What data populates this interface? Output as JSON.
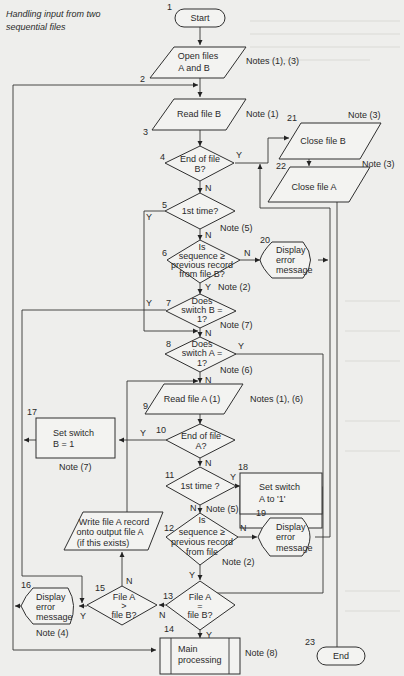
{
  "title": {
    "line1": "Handling input from two",
    "line2": "sequential files"
  },
  "colors": {
    "background": "#eeeeec",
    "line": "#333333",
    "shape_fill": "#f3f3f1"
  },
  "nodes": {
    "n1": {
      "num": "1",
      "type": "terminal",
      "label": "Start"
    },
    "n2": {
      "num": "2"
    },
    "n2box": {
      "type": "io",
      "line1": "Open files",
      "line2": "A and B",
      "note": "Notes (1), (3)"
    },
    "n3": {
      "num": "3",
      "type": "io",
      "label": "Read file B",
      "note": "Note (1)"
    },
    "n4": {
      "num": "4",
      "type": "decision",
      "line1": "End of file",
      "line2": "B?",
      "yes": "Y",
      "no": "N"
    },
    "n5": {
      "num": "5",
      "type": "decision",
      "label": "1st time?",
      "yes": "Y",
      "no": "N",
      "note": "Note (5)"
    },
    "n6": {
      "num": "6",
      "type": "decision",
      "line1": "Is",
      "line2": "sequence ≥",
      "line3": "previous record",
      "line4": "from file B?",
      "yes": "Y",
      "no": "N",
      "note": "Note (2)"
    },
    "n7": {
      "num": "7",
      "type": "decision",
      "line1": "Does",
      "line2": "switch B =",
      "line3": "1?",
      "yes": "Y",
      "no": "N",
      "note": "Note (7)"
    },
    "n8": {
      "num": "8",
      "type": "decision",
      "line1": "Does",
      "line2": "switch A =",
      "line3": "1?",
      "yes": "Y",
      "no": "N",
      "note": "Note (6)"
    },
    "n9": {
      "num": "9",
      "type": "io",
      "label": "Read file A (1)",
      "note": "Notes (1), (6)"
    },
    "n10": {
      "num": "10",
      "type": "decision",
      "line1": "End of file",
      "line2": "A?",
      "yes": "Y",
      "no": "N"
    },
    "n11": {
      "num": "11",
      "type": "decision",
      "label": "1st time ?",
      "yes": "Y",
      "no": "N",
      "note": "Note (5)"
    },
    "n12": {
      "num": "12",
      "type": "decision",
      "line1": "Is",
      "line2": "sequence ≥",
      "line3": "previous record",
      "line4": "from file",
      "yes": "Y",
      "no": "N",
      "note": "Note (2)"
    },
    "n13": {
      "num": "13",
      "type": "decision",
      "line1": "File A",
      "line2": "=",
      "line3": "file B?",
      "yes": "Y",
      "no": "N"
    },
    "n14": {
      "num": "14",
      "type": "predefined",
      "line1": "Main",
      "line2": "processing",
      "note": "Note (8)"
    },
    "n15": {
      "num": "15",
      "type": "decision",
      "line1": "File A",
      "line2": ">",
      "line3": "file B?",
      "yes": "Y",
      "no": "N"
    },
    "n16": {
      "num": "16",
      "type": "display",
      "line1": "Display",
      "line2": "error",
      "line3": "message",
      "note": "Note (4)"
    },
    "n17": {
      "num": "17",
      "type": "process",
      "line1": "Set switch",
      "line2": "B = 1",
      "note": "Note (7)"
    },
    "n18": {
      "num": "18",
      "type": "process",
      "line1": "Set switch",
      "line2": "A to '1'"
    },
    "n19": {
      "num": "19",
      "type": "display",
      "line1": "Display",
      "line2": "error",
      "line3": "message"
    },
    "n20": {
      "num": "20",
      "type": "display",
      "line1": "Display",
      "line2": "error",
      "line3": "message"
    },
    "n21": {
      "num": "21",
      "type": "io",
      "label": "Close file B",
      "note": "Note (3)"
    },
    "n22": {
      "num": "22",
      "type": "io",
      "label": "Close file A",
      "note": "Note (3)"
    },
    "n23": {
      "num": "23",
      "type": "terminal",
      "label": "End"
    },
    "write": {
      "type": "io",
      "line1": "Write file A record",
      "line2": "onto output file A",
      "line3": "(if this exists)"
    }
  }
}
